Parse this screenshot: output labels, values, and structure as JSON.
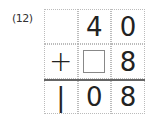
{
  "problem": {
    "label": "(12)",
    "rows": [
      [
        "",
        "4",
        "0"
      ],
      [
        "+",
        "[blank]",
        "8"
      ],
      [
        "1",
        "0",
        "8"
      ]
    ],
    "operator": "+",
    "blank_placeholder": ""
  }
}
